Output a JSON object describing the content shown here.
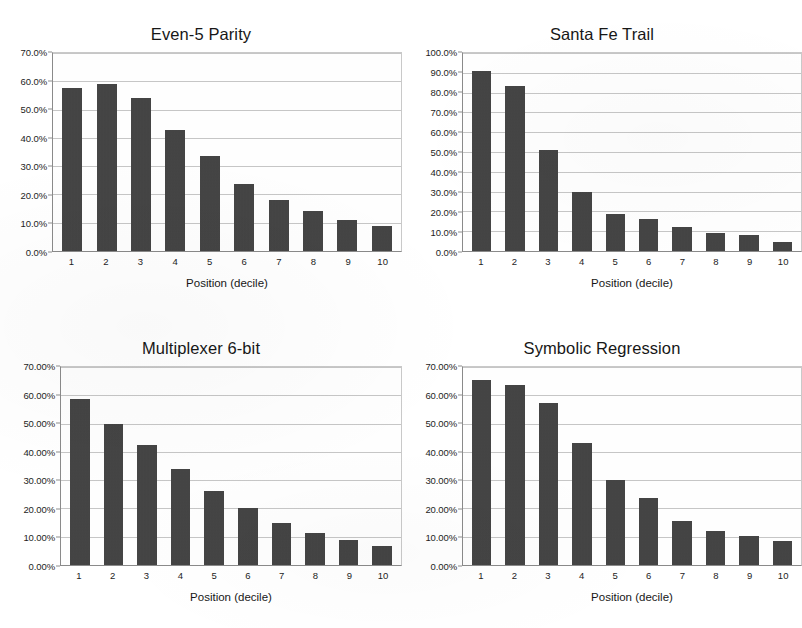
{
  "page": {
    "background": "#ffffff",
    "bar_color": "#3b3b3b",
    "grid_color": "#c6c6c6",
    "axis_color": "#8a8a8a"
  },
  "charts": [
    {
      "id": "even5-parity",
      "title": "Even-5 Parity",
      "xlabel": "Position (decile)",
      "ylabel": "",
      "ytick_labels": [
        "70.0%",
        "60.0%",
        "50.0%",
        "40.0%",
        "30.0%",
        "20.0%",
        "10.0%",
        "0.0%"
      ],
      "categories": [
        "1",
        "2",
        "3",
        "4",
        "5",
        "6",
        "7",
        "8",
        "9",
        "10"
      ],
      "values": [
        57.5,
        59.0,
        54.0,
        42.8,
        33.7,
        23.6,
        18.0,
        14.2,
        11.0,
        9.0
      ],
      "ylim": [
        0,
        70
      ],
      "ystep": 10
    },
    {
      "id": "santa-fe-trail",
      "title": "Santa Fe Trail",
      "xlabel": "Position (decile)",
      "ylabel": "",
      "ytick_labels": [
        "100.0%",
        "90.0%",
        "80.0%",
        "70.0%",
        "60.0%",
        "50.0%",
        "40.0%",
        "30.0%",
        "20.0%",
        "10.0%",
        "0.0%"
      ],
      "categories": [
        "1",
        "2",
        "3",
        "4",
        "5",
        "6",
        "7",
        "8",
        "9",
        "10"
      ],
      "values": [
        90.8,
        83.5,
        51.0,
        30.0,
        18.8,
        16.0,
        11.9,
        9.0,
        8.0,
        4.7
      ],
      "ylim": [
        0,
        100
      ],
      "ystep": 10
    },
    {
      "id": "multiplexer-6-bit",
      "title": "Multiplexer 6-bit",
      "xlabel": "Position (decile)",
      "ylabel": "",
      "ytick_labels": [
        "70.00%",
        "60.00%",
        "50.00%",
        "40.00%",
        "30.00%",
        "20.00%",
        "10.00%",
        "0.00%"
      ],
      "categories": [
        "1",
        "2",
        "3",
        "4",
        "5",
        "6",
        "7",
        "8",
        "9",
        "10"
      ],
      "values": [
        58.7,
        49.7,
        42.4,
        34.0,
        26.3,
        20.3,
        15.0,
        11.3,
        8.9,
        6.6
      ],
      "ylim": [
        0,
        70
      ],
      "ystep": 10
    },
    {
      "id": "symbolic-regression",
      "title": "Symbolic Regression",
      "xlabel": "Position (decile)",
      "ylabel": "",
      "ytick_labels": [
        "70.00%",
        "60.00%",
        "50.00%",
        "40.00%",
        "30.00%",
        "20.00%",
        "10.00%",
        "0.00%"
      ],
      "categories": [
        "1",
        "2",
        "3",
        "4",
        "5",
        "6",
        "7",
        "8",
        "9",
        "10"
      ],
      "values": [
        65.3,
        63.7,
        57.2,
        43.0,
        30.0,
        23.8,
        15.7,
        12.1,
        10.4,
        8.4
      ],
      "ylim": [
        0,
        70
      ],
      "ystep": 10
    }
  ],
  "chart_data": [
    {
      "type": "bar",
      "title": "Even-5 Parity",
      "xlabel": "Position (decile)",
      "ylabel": "",
      "categories": [
        "1",
        "2",
        "3",
        "4",
        "5",
        "6",
        "7",
        "8",
        "9",
        "10"
      ],
      "values": [
        57.5,
        59.0,
        54.0,
        42.8,
        33.7,
        23.6,
        18.0,
        14.2,
        11.0,
        9.0
      ],
      "unit": "percent",
      "ylim": [
        0,
        70
      ],
      "ytick_labels": [
        "0.0%",
        "10.0%",
        "20.0%",
        "30.0%",
        "40.0%",
        "50.0%",
        "60.0%",
        "70.0%"
      ],
      "grid": true,
      "legend": "none"
    },
    {
      "type": "bar",
      "title": "Santa Fe Trail",
      "xlabel": "Position (decile)",
      "ylabel": "",
      "categories": [
        "1",
        "2",
        "3",
        "4",
        "5",
        "6",
        "7",
        "8",
        "9",
        "10"
      ],
      "values": [
        90.8,
        83.5,
        51.0,
        30.0,
        18.8,
        16.0,
        11.9,
        9.0,
        8.0,
        4.7
      ],
      "unit": "percent",
      "ylim": [
        0,
        100
      ],
      "ytick_labels": [
        "0.0%",
        "10.0%",
        "20.0%",
        "30.0%",
        "40.0%",
        "50.0%",
        "60.0%",
        "70.0%",
        "80.0%",
        "90.0%",
        "100.0%"
      ],
      "grid": true,
      "legend": "none"
    },
    {
      "type": "bar",
      "title": "Multiplexer 6-bit",
      "xlabel": "Position (decile)",
      "ylabel": "",
      "categories": [
        "1",
        "2",
        "3",
        "4",
        "5",
        "6",
        "7",
        "8",
        "9",
        "10"
      ],
      "values": [
        58.7,
        49.7,
        42.4,
        34.0,
        26.3,
        20.3,
        15.0,
        11.3,
        8.9,
        6.6
      ],
      "unit": "percent",
      "ylim": [
        0,
        70
      ],
      "ytick_labels": [
        "0.00%",
        "10.00%",
        "20.00%",
        "30.00%",
        "40.00%",
        "50.00%",
        "60.00%",
        "70.00%"
      ],
      "grid": true,
      "legend": "none"
    },
    {
      "type": "bar",
      "title": "Symbolic Regression",
      "xlabel": "Position (decile)",
      "ylabel": "",
      "categories": [
        "1",
        "2",
        "3",
        "4",
        "5",
        "6",
        "7",
        "8",
        "9",
        "10"
      ],
      "values": [
        65.3,
        63.7,
        57.2,
        43.0,
        30.0,
        23.8,
        15.7,
        12.1,
        10.4,
        8.4
      ],
      "unit": "percent",
      "ylim": [
        0,
        70
      ],
      "ytick_labels": [
        "0.00%",
        "10.00%",
        "20.00%",
        "30.00%",
        "40.00%",
        "50.00%",
        "60.00%",
        "70.00%"
      ],
      "grid": true,
      "legend": "none"
    }
  ]
}
